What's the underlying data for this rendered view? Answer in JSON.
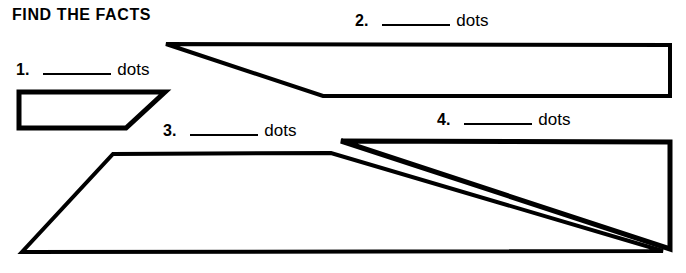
{
  "worksheet": {
    "title": "FIND THE FACTS",
    "background_color": "#ffffff",
    "ink_color": "#000000",
    "unit_word": "dots",
    "items": [
      {
        "number": "1.",
        "blank": "",
        "unit": "dots"
      },
      {
        "number": "2.",
        "blank": "",
        "unit": "dots"
      },
      {
        "number": "3.",
        "blank": "",
        "unit": "dots"
      },
      {
        "number": "4.",
        "blank": "",
        "unit": "dots"
      }
    ]
  },
  "figures": [
    {
      "name": "figure-1-trapezoid",
      "label": "1.",
      "shape": "trapezoid",
      "points": "19,92 165,92 126,128 19,128"
    },
    {
      "name": "figure-2-quadrilateral",
      "label": "2.",
      "shape": "quadrilateral",
      "points": "166,44 670,45 670,96 323,96"
    },
    {
      "name": "figure-3-trapezoid",
      "label": "3.",
      "shape": "trapezoid",
      "points": "113,154 331,153 663,251 22,252"
    },
    {
      "name": "figure-4-triangle",
      "label": "4.",
      "shape": "triangle",
      "points": "341,141 670,142 670,249"
    }
  ]
}
